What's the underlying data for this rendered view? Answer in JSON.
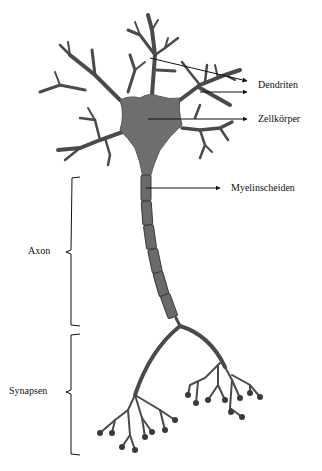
{
  "diagram": {
    "labels": {
      "dendrites": "Dendriten",
      "cell_body": "Zellkörper",
      "myelin": "Myelinscheiden",
      "axon": "Axon",
      "synapses": "Synapsen"
    },
    "colors": {
      "neuron_fill": "#6e6e6e",
      "neuron_dark": "#3a3a3a",
      "line": "#111111",
      "background": "#ffffff"
    }
  }
}
